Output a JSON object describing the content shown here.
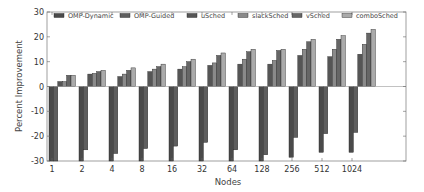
{
  "chart_data": {
    "type": "bar",
    "title": "",
    "xlabel": "Nodes",
    "ylabel": "Percent Improvement",
    "ylim": [
      -30,
      30
    ],
    "yticks": [
      -30,
      -20,
      -10,
      0,
      10,
      20,
      30
    ],
    "grid": false,
    "legend_position": "top, inside, 3 columns",
    "categories": [
      "1",
      "2",
      "4",
      "8",
      "16",
      "32",
      "64",
      "128",
      "256",
      "512",
      "1024"
    ],
    "series": [
      {
        "name": "OMP-Dynamic",
        "color": "#4a4a4a",
        "values": [
          -30,
          -30,
          -30,
          -30,
          -30,
          -30,
          -30,
          -30,
          -28.5,
          -26.5,
          -26.5
        ]
      },
      {
        "name": "OMP-Guided",
        "color": "#5e5e5e",
        "values": [
          -30,
          -25.5,
          -27,
          -25,
          -24,
          -22.5,
          -25.5,
          -27.5,
          -20.5,
          -19,
          -18.5
        ]
      },
      {
        "name": "uSched",
        "color": "#555555",
        "values": [
          2,
          5,
          4,
          6,
          7,
          8.5,
          9,
          9,
          12.5,
          12,
          13
        ]
      },
      {
        "name": "slackSched",
        "color": "#8a8a8a",
        "values": [
          2,
          5.3,
          5,
          7,
          8,
          9.5,
          11,
          10.5,
          15,
          15,
          17
        ]
      },
      {
        "name": "vSched",
        "color": "#666666",
        "values": [
          4.5,
          6,
          6.5,
          8,
          10,
          12.5,
          14,
          14.5,
          18,
          19,
          21.5
        ]
      },
      {
        "name": "comboSched",
        "color": "#aaaaaa",
        "values": [
          4.5,
          6.5,
          7.5,
          9,
          11,
          13.5,
          15,
          15,
          19,
          20.5,
          23
        ]
      }
    ]
  }
}
